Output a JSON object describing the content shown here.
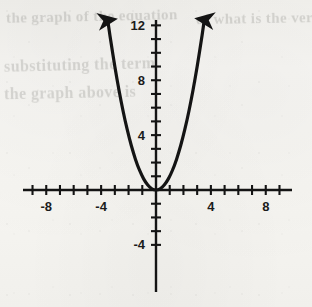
{
  "figure": {
    "kind": "coordinate-plane-graph",
    "background_color": "#f6f5f1",
    "ink_color": "#141414"
  },
  "ghost_text": {
    "note": "faint bleed-through text from the reverse side of the scanned page, largely illegible",
    "lines": [
      {
        "text": "the graph of the equation",
        "x": 6,
        "y": 8,
        "size": 15,
        "skew": -1.2
      },
      {
        "text": "of what is the vertex",
        "x": 196,
        "y": 10,
        "size": 15,
        "skew": -1.0
      },
      {
        "text": "substituting the term",
        "x": 4,
        "y": 56,
        "size": 16,
        "skew": -1.4
      },
      {
        "text": "the graph above is",
        "x": 4,
        "y": 84,
        "size": 16,
        "skew": -1.1
      }
    ]
  },
  "chart_data": {
    "type": "line",
    "title": "",
    "xlabel": "",
    "ylabel": "",
    "equation": "y = x^2",
    "xlim": [
      -9.7,
      9.9
    ],
    "ylim": [
      -5.0,
      12.4
    ],
    "grid": false,
    "legend": null,
    "axes": {
      "x_axis": {
        "tick_interval": 1,
        "labeled_ticks": [
          -8,
          -4,
          4,
          8
        ],
        "labels": [
          "-8",
          "-4",
          "4",
          "8"
        ],
        "tick_values": [
          -9,
          -8,
          -7,
          -6,
          -5,
          -4,
          -3,
          -2,
          -1,
          1,
          2,
          3,
          4,
          5,
          6,
          7,
          8,
          9
        ],
        "arrowheads": false
      },
      "y_axis": {
        "tick_interval": 1,
        "labeled_ticks": [
          12,
          8,
          4,
          -4
        ],
        "labels": [
          "12",
          "8",
          "4",
          "-4"
        ],
        "tick_values": [
          12,
          11,
          10,
          9,
          8,
          7,
          6,
          5,
          4,
          3,
          2,
          1,
          -1,
          -2,
          -3,
          -4
        ],
        "arrowheads": false
      }
    },
    "series": [
      {
        "name": "y = x^2",
        "style": "solid",
        "color": "#141414",
        "width": 3.2,
        "arrow_ends": "both",
        "vertex": [
          0,
          0
        ],
        "x": [
          -3.52,
          -3.3,
          -3.0,
          -2.7,
          -2.4,
          -2.1,
          -1.8,
          -1.5,
          -1.2,
          -0.9,
          -0.6,
          -0.3,
          0,
          0.3,
          0.6,
          0.9,
          1.2,
          1.5,
          1.8,
          2.1,
          2.4,
          2.7,
          3.0,
          3.3,
          3.52
        ],
        "values": [
          12.39,
          10.89,
          9.0,
          7.29,
          5.76,
          4.41,
          3.24,
          2.25,
          1.44,
          0.81,
          0.36,
          0.09,
          0,
          0.09,
          0.36,
          0.81,
          1.44,
          2.25,
          3.24,
          4.41,
          5.76,
          7.29,
          9.0,
          10.89,
          12.39
        ]
      }
    ]
  }
}
